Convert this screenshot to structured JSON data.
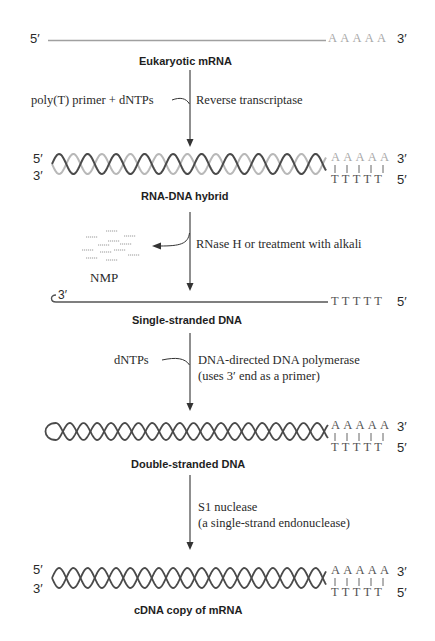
{
  "diagram": {
    "stages": [
      {
        "id": "mrna",
        "label": "Eukaryotic mRNA",
        "left_top_end": "5′",
        "right_top_end": "3′",
        "top_bases": "AAAAA"
      },
      {
        "id": "hybrid",
        "label": "RNA-DNA hybrid",
        "left_top_end": "5′",
        "left_bottom_end": "3′",
        "right_top_end": "3′",
        "right_bottom_end": "5′",
        "top_bases": "AAAAA",
        "bottom_bases": "TTTTT"
      },
      {
        "id": "ssdna",
        "label": "Single-stranded DNA",
        "left_top_end": "3′",
        "right_top_end": "5′",
        "top_bases": "TTTTT"
      },
      {
        "id": "dsdna",
        "label": "Double-stranded DNA",
        "right_top_end": "3′",
        "right_bottom_end": "5′",
        "top_bases": "AAAAA",
        "bottom_bases": "TTTTT"
      },
      {
        "id": "cdna",
        "label": "cDNA copy of mRNA",
        "left_top_end": "5′",
        "left_bottom_end": "3′",
        "right_top_end": "3′",
        "right_bottom_end": "5′",
        "top_bases": "AAAAA",
        "bottom_bases": "TTTTT"
      }
    ],
    "steps": [
      {
        "input": "poly(T) primer + dNTPs",
        "enzyme_line1": "Reverse transcriptase"
      },
      {
        "output": "NMP",
        "enzyme_line1": "RNase H or treatment with alkali"
      },
      {
        "input": "dNTPs",
        "enzyme_line1": "DNA-directed DNA polymerase",
        "enzyme_line2": "(uses 3′ end as a primer)"
      },
      {
        "enzyme_line1": "S1 nuclease",
        "enzyme_line2": "(a single-strand endonuclease)"
      }
    ],
    "colors": {
      "rna_strand": "#b4b4b4",
      "dna_strand": "#4a4a4a",
      "arrow": "#333333",
      "text": "#222222"
    }
  }
}
